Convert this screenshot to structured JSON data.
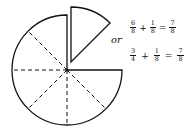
{
  "diagram": {
    "main_shape": {
      "fraction": "6/8",
      "center": [
        67,
        70
      ],
      "radius": 55
    },
    "detached_slice": {
      "fraction": "1/8",
      "vertex": [
        71,
        62
      ]
    }
  },
  "connector": "or",
  "equations": [
    {
      "terms": [
        {
          "num": "6",
          "den": "8"
        },
        {
          "op": "+"
        },
        {
          "num": "1",
          "den": "8"
        },
        {
          "op": "="
        },
        {
          "num": "7",
          "den": "8"
        }
      ]
    },
    {
      "terms": [
        {
          "num": "3",
          "den": "4"
        },
        {
          "op": "+"
        },
        {
          "num": "1",
          "den": "8"
        },
        {
          "op": "="
        },
        {
          "num": "7",
          "den": "8"
        }
      ]
    }
  ],
  "colors": {
    "stroke": "#111111",
    "background": "#ffffff"
  }
}
